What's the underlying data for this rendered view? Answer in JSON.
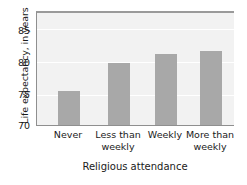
{
  "chart_data": {
    "type": "bar",
    "title": "",
    "xlabel": "Religious attendance",
    "ylabel": "Life expectancy, in years",
    "categories": [
      "Never",
      "Less than weekly",
      "Weekly",
      "More than weekly"
    ],
    "category_lines": [
      [
        "Never"
      ],
      [
        "Less than",
        "weekly"
      ],
      [
        "Weekly"
      ],
      [
        "More than",
        "weekly"
      ]
    ],
    "values": [
      75.3,
      79.6,
      80.9,
      81.4
    ],
    "ylim": [
      70,
      87.5
    ],
    "yticks": [
      70,
      75,
      80,
      85
    ],
    "ytick_labels": [
      "70",
      "75",
      "80",
      "85"
    ],
    "grid": true,
    "grid_orientation": "horizontal",
    "legend": null,
    "colors": {
      "bar": "#a8a8a8",
      "plot_background": "#f2f2f2",
      "gridline": "#ffffff",
      "axis": "#8f8f8f",
      "text": "#1a1a1a"
    }
  }
}
